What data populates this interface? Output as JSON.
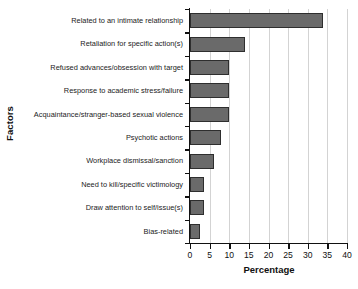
{
  "chart_data": {
    "type": "bar",
    "orientation": "horizontal",
    "title": "",
    "xlabel": "Percentage",
    "ylabel": "Factors",
    "xlim": [
      0,
      40
    ],
    "xticks": [
      0,
      5,
      10,
      15,
      20,
      25,
      30,
      35,
      40
    ],
    "grid": "vertical gridlines at x ticks",
    "legend": "none",
    "bar_color": "#6a6a6a",
    "bar_edge_color": "#2e2e2e",
    "gridline_color": "#d3d3d3",
    "axis_color": "#111111",
    "categories": [
      "Related to an intimate relationship",
      "Retaliation for specific action(s)",
      "Refused advances/obsession with target",
      "Response to academic stress/failure",
      "Acquaintance/stranger-based sexual violence",
      "Psychotic actions",
      "Workplace dismissal/sanction",
      "Need to kill/specific victimology",
      "Draw attention to self/issue(s)",
      "Bias-related"
    ],
    "values": [
      34,
      14,
      10,
      10,
      10,
      8,
      6,
      3.5,
      3.5,
      2.5
    ]
  }
}
